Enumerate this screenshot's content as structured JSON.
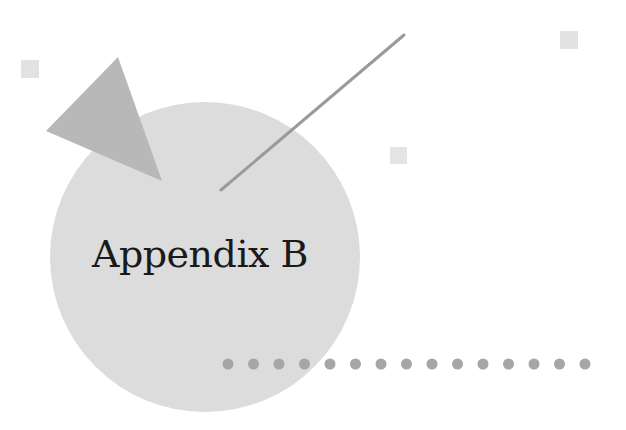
{
  "page": {
    "title": "Appendix B"
  },
  "colors": {
    "background": "#ffffff",
    "circle": "#dcdcdc",
    "triangle": "#b8b8b8",
    "line": "#9a9a9a",
    "dots": "#a6a6a6",
    "small_squares": "#e2e2e2",
    "text": "#1a1a1a"
  },
  "decorations": {
    "dot_count": 15
  }
}
